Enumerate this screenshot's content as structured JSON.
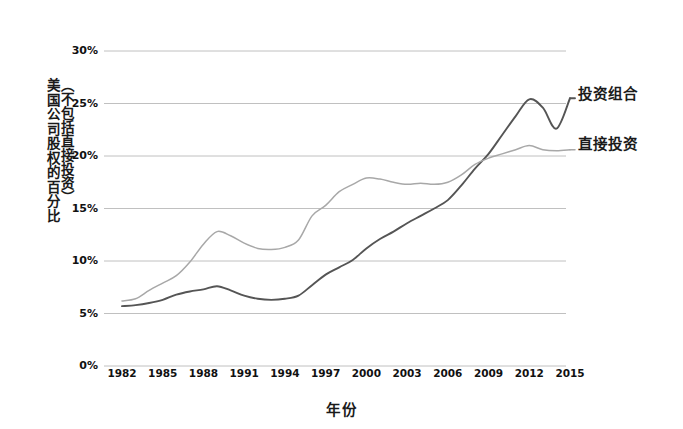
{
  "axes": {
    "ylabel_main": "美国公司股权的百分比",
    "ylabel_paren": "（不包括直接投资）",
    "xlabel": "年份",
    "yticks": [
      "0%",
      "5%",
      "10%",
      "15%",
      "20%",
      "25%",
      "30%"
    ],
    "xticks": [
      "1982",
      "1985",
      "1988",
      "1991",
      "1994",
      "1997",
      "2000",
      "2003",
      "2006",
      "2009",
      "2012",
      "2015"
    ]
  },
  "legend": {
    "portfolio": "投资组合",
    "direct": "直接投资"
  },
  "colors": {
    "portfolio_line": "#555555",
    "direct_line": "#a8a8a8",
    "gridline": "#b9b9b9",
    "text": "#1a1a1a",
    "background": "#ffffff"
  },
  "chart_data": {
    "type": "line",
    "title": "",
    "xlabel": "年份",
    "ylabel": "美国公司股权的百分比（不包括直接投资）",
    "xlim": [
      1982,
      2015
    ],
    "ylim": [
      0,
      30
    ],
    "ytick_values": [
      0,
      5,
      10,
      15,
      20,
      25,
      30
    ],
    "xtick_values": [
      1982,
      1985,
      1988,
      1991,
      1994,
      1997,
      2000,
      2003,
      2006,
      2009,
      2012,
      2015
    ],
    "grid": "horizontal",
    "legend_position": "right-of-plot-line-end",
    "x": [
      1982,
      1983,
      1984,
      1985,
      1986,
      1987,
      1988,
      1989,
      1990,
      1991,
      1992,
      1993,
      1994,
      1995,
      1996,
      1997,
      1998,
      1999,
      2000,
      2001,
      2002,
      2003,
      2004,
      2005,
      2006,
      2007,
      2008,
      2009,
      2010,
      2011,
      2012,
      2013,
      2014,
      2015
    ],
    "series": [
      {
        "name": "投资组合",
        "color": "#555555",
        "values": [
          5.7,
          5.8,
          6.0,
          6.3,
          6.8,
          7.1,
          7.3,
          7.6,
          7.2,
          6.7,
          6.4,
          6.3,
          6.4,
          6.7,
          7.7,
          8.7,
          9.4,
          10.1,
          11.2,
          12.1,
          12.8,
          13.6,
          14.3,
          15.0,
          15.8,
          17.2,
          18.8,
          20.2,
          22.0,
          23.8,
          25.4,
          24.6,
          22.6,
          25.5
        ]
      },
      {
        "name": "直接投资",
        "color": "#a8a8a8",
        "values": [
          6.2,
          6.4,
          7.2,
          7.9,
          8.6,
          9.9,
          11.6,
          12.8,
          12.4,
          11.7,
          11.2,
          11.1,
          11.3,
          12.0,
          14.3,
          15.3,
          16.6,
          17.3,
          17.9,
          17.8,
          17.5,
          17.3,
          17.4,
          17.3,
          17.5,
          18.2,
          19.2,
          19.8,
          20.2,
          20.6,
          21.0,
          20.6,
          20.5,
          20.6
        ]
      }
    ]
  }
}
